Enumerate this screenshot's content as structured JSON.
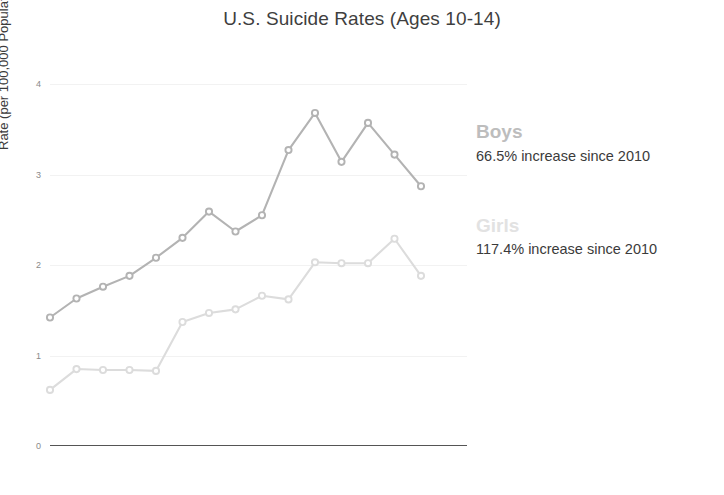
{
  "chart_data": {
    "type": "line",
    "title": "U.S. Suicide Rates (Ages 10-14)",
    "xlabel": "",
    "ylabel": "Rate (per 100,000 Population)",
    "categories": [
      "2008",
      "2009",
      "2010",
      "2011",
      "2012",
      "2013",
      "2014",
      "2015",
      "2016",
      "2017",
      "2018",
      "2019",
      "2020",
      "2021",
      "2022"
    ],
    "ylim": [
      0,
      4
    ],
    "yticks": [
      0,
      1,
      2,
      3,
      4
    ],
    "ytick_labels": [
      "0",
      "1",
      "2",
      "3",
      "4"
    ],
    "grid": true,
    "legend_position": "right",
    "series": [
      {
        "name": "Boys",
        "color": "#b3b3b3",
        "values": [
          1.42,
          1.63,
          1.76,
          1.88,
          2.08,
          2.3,
          2.59,
          2.37,
          2.55,
          3.27,
          3.68,
          3.14,
          3.57,
          3.22,
          2.87
        ]
      },
      {
        "name": "Girls",
        "color": "#dcdcdc",
        "values": [
          0.62,
          0.85,
          0.84,
          0.84,
          0.83,
          1.37,
          1.47,
          1.51,
          1.66,
          1.62,
          2.03,
          2.02,
          2.02,
          2.29,
          1.88
        ]
      }
    ]
  },
  "legend": {
    "entries": [
      {
        "name": "Boys",
        "label": "Boys",
        "note": "66.5% increase since 2010",
        "color": "#bdbdbd"
      },
      {
        "name": "Girls",
        "label": "Girls",
        "note": "117.4% increase since 2010",
        "color": "#e2e2e2"
      }
    ]
  },
  "axes": {
    "y_title": "Rate (per 100,000 Population)"
  }
}
